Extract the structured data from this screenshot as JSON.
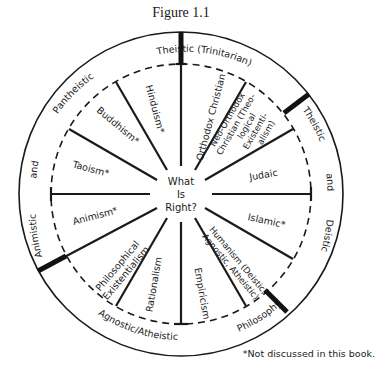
{
  "figure": {
    "title": "Figure 1.1",
    "center_question": [
      "What",
      "Is",
      "Right?"
    ],
    "footnote": "*Not discussed in this book."
  },
  "outer_ring": {
    "labels": [
      "Theistic (Trinitarian)",
      "Theistic",
      "and",
      "Deistic",
      "Philosophy",
      "Agnostic/Atheistic",
      "Animistic",
      "and",
      "Pantheistic"
    ]
  },
  "sectors": [
    {
      "label": "Orthodox Christian"
    },
    {
      "label_lines": [
        "Neo-Orthodox",
        "Christian (Theo-",
        "logical",
        "Existenti-",
        "alism)"
      ]
    },
    {
      "label": "Judaic"
    },
    {
      "label": "Islamic*"
    },
    {
      "label_lines": [
        "Humanism (Deistic,",
        "Agnostic, Atheistic)"
      ]
    },
    {
      "label": "Empiricism"
    },
    {
      "label": "Rationalism"
    },
    {
      "label_lines": [
        "Philosophical",
        "Existentialism"
      ]
    },
    {
      "label": "Animism*"
    },
    {
      "label": "Taoism*"
    },
    {
      "label": "Buddhism*"
    },
    {
      "label": "Hinduism*"
    }
  ],
  "colors": {
    "ink": "#1a1a1a",
    "background": "#ffffff"
  }
}
